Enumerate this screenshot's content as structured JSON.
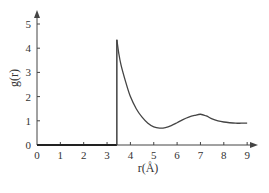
{
  "chart_data": {
    "type": "line",
    "title": "",
    "xlabel": "r(Å)",
    "ylabel": "g(r)",
    "xlim": [
      0,
      9.5
    ],
    "ylim": [
      0,
      5.5
    ],
    "x_ticks": [
      "0",
      "1",
      "2",
      "3",
      "4",
      "5",
      "6",
      "7",
      "8",
      "9"
    ],
    "y_ticks": [
      "0",
      "1",
      "2",
      "3",
      "4",
      "5"
    ],
    "grid": false,
    "legend": "none",
    "series": [
      {
        "name": "g(r)",
        "x": [
          0,
          3.42,
          3.42,
          3.5,
          3.6,
          3.8,
          4.0,
          4.25,
          4.5,
          4.75,
          5.0,
          5.25,
          5.5,
          5.75,
          6.0,
          6.25,
          6.5,
          6.75,
          7.0,
          7.25,
          7.5,
          7.75,
          8.0,
          8.25,
          8.5,
          8.75,
          9.0
        ],
        "y": [
          0,
          0,
          4.35,
          3.8,
          3.3,
          2.6,
          2.0,
          1.5,
          1.15,
          0.9,
          0.75,
          0.7,
          0.72,
          0.8,
          0.92,
          1.05,
          1.15,
          1.22,
          1.27,
          1.2,
          1.08,
          1.0,
          0.95,
          0.92,
          0.9,
          0.9,
          0.9
        ]
      }
    ]
  }
}
